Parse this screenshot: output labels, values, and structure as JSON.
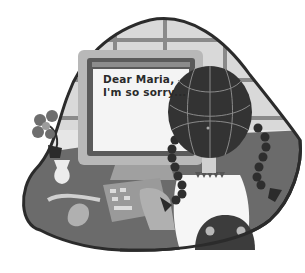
{
  "illustration": {
    "subject": "girl with braids typing an apology letter at a computer",
    "screen": {
      "line1": "Dear Maria,",
      "line2": "I'm so sorry..."
    },
    "colors": {
      "background": "#ffffff",
      "outline": "#2b2b2b",
      "desk": "#6b6b6b",
      "wall": "#d8d8d8",
      "window_frame": "#8a8a8a",
      "monitor": "#b8b8b8",
      "monitor_bezel": "#5a5a5a",
      "screen": "#f4f4f4",
      "hair": "#333333",
      "hair_lines": "#8a8a8a",
      "shirt": "#f6f6f6",
      "keyboard": "#9a9a9a",
      "flower": "#6e6e6e",
      "vase": "#ececec",
      "mouse": "#b0b0b0",
      "chair": "#3c3c3c"
    }
  }
}
